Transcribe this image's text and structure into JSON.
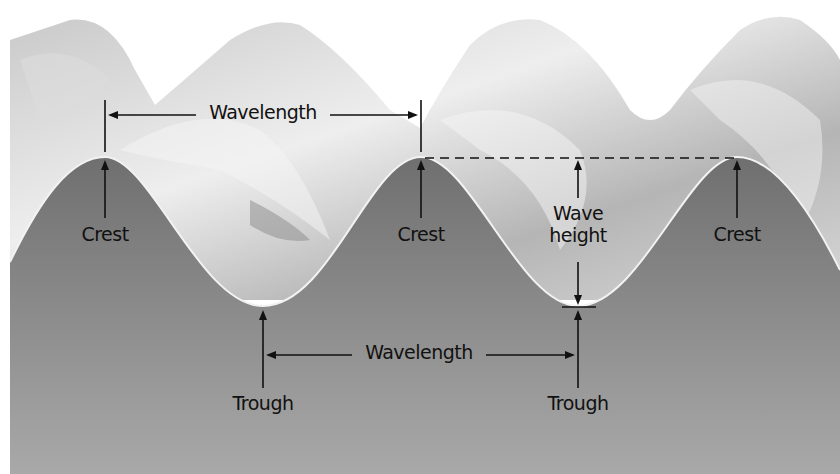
{
  "diagram": {
    "labels": {
      "wavelength_top": "Wavelength",
      "wavelength_bottom": "Wavelength",
      "crest_1": "Crest",
      "crest_2": "Crest",
      "crest_3": "Crest",
      "trough_1": "Trough",
      "trough_2": "Trough",
      "wave_height_line1": "Wave",
      "wave_height_line2": "height"
    },
    "colors": {
      "background": "#ffffff",
      "water_body": "#7a7a7a",
      "wave_surface_light": "#e8e8e8",
      "wave_surface_mid": "#a8a8a8",
      "profile_line": "#f2f2f2",
      "annotation": "#111111"
    },
    "points": {
      "crests_x": [
        105,
        421,
        737
      ],
      "crest_y": 157,
      "troughs_x": [
        263,
        578
      ],
      "trough_y": 306
    }
  }
}
